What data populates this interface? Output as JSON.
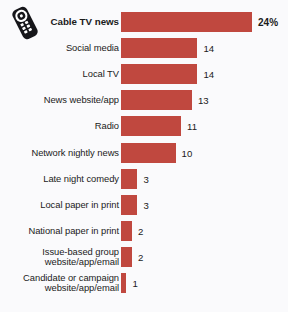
{
  "icon": {
    "name": "tv-remote-icon"
  },
  "chart_data": {
    "type": "bar",
    "orientation": "horizontal",
    "title": "",
    "xlabel": "",
    "ylabel": "",
    "grid": false,
    "legend": null,
    "xlim": [
      0,
      24
    ],
    "bar_color": "#c0483f",
    "background_color": "#fafafc",
    "text_color": "#1b1b1b",
    "categories": [
      "Cable TV news",
      "Social media",
      "Local TV",
      "News website/app",
      "Radio",
      "Network nightly news",
      "Late night comedy",
      "Local paper in print",
      "National paper in print",
      "Issue-based group\nwebsite/app/email",
      "Candidate or campaign\nwebsite/app/email"
    ],
    "values": [
      24,
      14,
      14,
      13,
      11,
      10,
      3,
      3,
      2,
      2,
      1
    ],
    "value_labels": [
      "24%",
      "14",
      "14",
      "13",
      "11",
      "10",
      "3",
      "3",
      "2",
      "2",
      "1"
    ],
    "emphasized_index": 0
  }
}
